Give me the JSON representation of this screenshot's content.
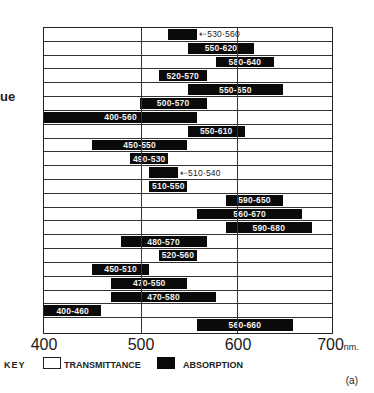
{
  "side_text": "ue",
  "chart_data": {
    "type": "bar",
    "subtype": "horizontal-range",
    "title": "",
    "xlabel": "nm.",
    "ylabel": "",
    "xlim": [
      400,
      700
    ],
    "x_ticks": [
      "400",
      "500",
      "600",
      "700"
    ],
    "x_unit": "nm.",
    "grid_vertical_at": [
      500,
      600
    ],
    "legend": [
      {
        "name": "TRANSMITTANCE",
        "style": "white box outline"
      },
      {
        "name": "ABSORPTION",
        "style": "black filled"
      }
    ],
    "legend_prefix": "KEY",
    "panel_label": "(a)",
    "rows": [
      {
        "label": "⇠530·560",
        "start": 530,
        "end": 560,
        "label_outside": true
      },
      {
        "label": "550-620",
        "start": 550,
        "end": 620
      },
      {
        "label": "580-640",
        "start": 580,
        "end": 640
      },
      {
        "label": "520-570",
        "start": 520,
        "end": 570
      },
      {
        "label": "550-650",
        "start": 550,
        "end": 650
      },
      {
        "label": "500-570",
        "start": 500,
        "end": 570
      },
      {
        "label": "400-560",
        "start": 400,
        "end": 560
      },
      {
        "label": "550-610",
        "start": 550,
        "end": 610
      },
      {
        "label": "450-550",
        "start": 450,
        "end": 550
      },
      {
        "label": "490-530",
        "start": 490,
        "end": 530
      },
      {
        "label": "⇠510·540",
        "start": 510,
        "end": 540,
        "label_outside": true
      },
      {
        "label": "510-550",
        "start": 510,
        "end": 550
      },
      {
        "label": "590-650",
        "start": 590,
        "end": 650
      },
      {
        "label": "560-670",
        "start": 560,
        "end": 670
      },
      {
        "label": "590-680",
        "start": 590,
        "end": 680
      },
      {
        "label": "480-570",
        "start": 480,
        "end": 570
      },
      {
        "label": "520-560",
        "start": 520,
        "end": 560
      },
      {
        "label": "450-510",
        "start": 450,
        "end": 510
      },
      {
        "label": "470-550",
        "start": 470,
        "end": 550
      },
      {
        "label": "470-580",
        "start": 470,
        "end": 580
      },
      {
        "label": "400-460",
        "start": 400,
        "end": 460
      },
      {
        "label": "560-660",
        "start": 560,
        "end": 660
      }
    ]
  },
  "legend": {
    "key_label": "KEY",
    "transmittance_label": "TRANSMITTANCE",
    "absorption_label": "ABSORPTION"
  },
  "axis": {
    "tick_400": "400",
    "tick_500": "500",
    "tick_600": "600",
    "tick_700": "700",
    "unit": "nm."
  },
  "panel_label": "(a)"
}
